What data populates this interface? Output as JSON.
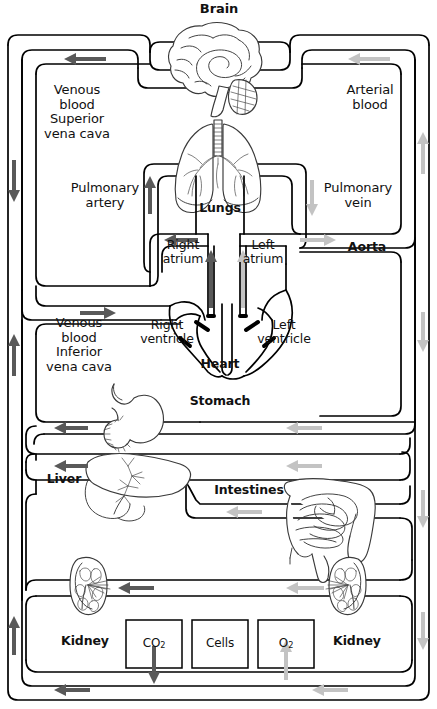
{
  "diagram": {
    "type": "anatomical-flow-diagram",
    "colors": {
      "vessel_outline": "#000000",
      "venous_arrow": "#595959",
      "arterial_arrow": "#c3c3c3",
      "organ_outline": "#3a3a3a",
      "background": "#ffffff"
    }
  },
  "organs": {
    "brain": "Brain",
    "lungs": "Lungs",
    "heart": "Heart",
    "stomach": "Stomach",
    "liver": "Liver",
    "intestines": "Intestines",
    "kidney_left": "Kidney",
    "kidney_right": "Kidney"
  },
  "heart_parts": {
    "right_atrium": "Right\natrium",
    "left_atrium": "Left\natrium",
    "right_ventricle": "Right\nventricle",
    "left_ventricle": "Left\nventricle"
  },
  "vessels": {
    "venous_superior": "Venous\nblood\nSuperior\nvena cava",
    "venous_inferior": "Venous\nblood\nInferior\nvena cava",
    "arterial": "Arterial\nblood",
    "pulmonary_artery": "Pulmonary\nartery",
    "pulmonary_vein": "Pulmonary\nvein",
    "aorta": "Aorta"
  },
  "exchange_boxes": [
    {
      "id": "co2-box",
      "label": "CO",
      "subscript": "2",
      "flow": "out",
      "arrow": "venous"
    },
    {
      "id": "cells-box",
      "label": "Cells",
      "subscript": "",
      "flow": "none",
      "arrow": "none"
    },
    {
      "id": "o2-box",
      "label": "O",
      "subscript": "2",
      "flow": "in",
      "arrow": "arterial"
    }
  ],
  "flow_legend": {
    "venous": "Venous (deoxygenated) blood — dark arrows",
    "arterial": "Arterial (oxygenated) blood — light arrows"
  }
}
